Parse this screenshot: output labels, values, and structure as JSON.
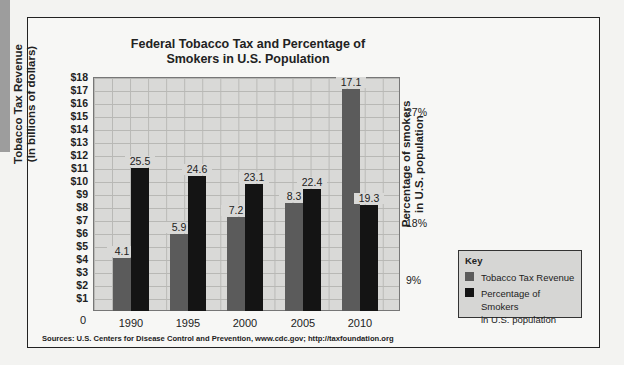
{
  "chart_data": {
    "type": "bar",
    "title": "Federal Tobacco Tax and Percentage of Smokers in U.S. Population",
    "title_lines": [
      "Federal Tobacco Tax and Percentage of",
      "Smokers in U.S. Population"
    ],
    "categories": [
      "1990",
      "1995",
      "2000",
      "2005",
      "2010"
    ],
    "series": [
      {
        "name": "Tobacco Tax Revenue",
        "axis": "left",
        "unit": "billions of dollars",
        "color": "#5b5b5b",
        "values": [
          4.1,
          5.9,
          7.2,
          8.3,
          17.1
        ]
      },
      {
        "name": "Percentage of Smokers in U.S. population",
        "axis": "right",
        "unit": "%",
        "color": "#141414",
        "values": [
          25.5,
          24.6,
          23.1,
          22.4,
          19.3
        ]
      }
    ],
    "xlabel": "",
    "ylabel": "Tobacco Tax Revenue (In billions of dollars)",
    "ylabel_lines": [
      "Tobacco Tax Revenue",
      "(In billions of dollars)"
    ],
    "y2label": "Percentage of smokers in U.S. population",
    "y2label_lines": [
      "Percentage of smokers",
      "in U.S. population"
    ],
    "ylim": [
      0,
      18
    ],
    "yticks": [
      "0",
      "$1",
      "$2",
      "$3",
      "$4",
      "$5",
      "$6",
      "$7",
      "$8",
      "$9",
      "$10",
      "$11",
      "$12",
      "$13",
      "$14",
      "$15",
      "$16",
      "$17",
      "$18"
    ],
    "y2ticks": [
      "9%",
      "18%",
      "27%"
    ],
    "grid": true,
    "legend_position": "lower right, outside plot",
    "legend_title": "Key",
    "legend": [
      "Tobacco Tax Revenue",
      "Percentage of Smokers in U.S. population"
    ],
    "legend_lines": [
      "Tobacco Tax Revenue",
      "Percentage of Smokers",
      "in U.S. population"
    ],
    "source": "Sources: U.S. Centers for Disease Control and Prevention, www.cdc.gov; http://taxfoundation.org"
  },
  "render": {
    "gray_heights_px": [
      53,
      77,
      94,
      108,
      222
    ],
    "black_heights_px": [
      143,
      135,
      127,
      122,
      106
    ],
    "gray_label_top": [
      246,
      222,
      205,
      191,
      77
    ],
    "black_label_top": [
      156,
      164,
      172,
      177,
      193
    ],
    "gray_left": [
      113,
      170,
      227,
      285,
      342
    ],
    "black_left": [
      131,
      188,
      245,
      303,
      360
    ]
  }
}
